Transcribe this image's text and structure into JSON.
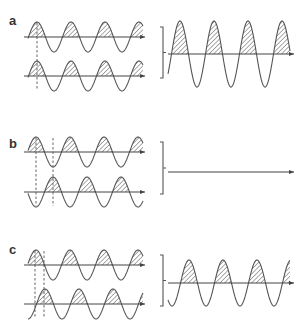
{
  "panels": [
    {
      "label": "a",
      "description": "Two in-phase waves sum to a wave of doubled amplitude (constructive interference)",
      "inputs": [
        {
          "axis_y": 37,
          "amp": 15,
          "phase_peak_x": 37,
          "period": 34
        },
        {
          "axis_y": 76,
          "amp": 15,
          "phase_peak_x": 37,
          "period": 34
        }
      ],
      "result": {
        "axis_y": 54,
        "amp": 33,
        "phase_peak_x": 180,
        "period": 34
      },
      "dashed_lines_x": [
        37
      ]
    },
    {
      "label": "b",
      "description": "Two waves half a period out of phase cancel (destructive interference)",
      "inputs": [
        {
          "axis_y": 152,
          "amp": 15,
          "phase_peak_x": 36,
          "period": 34
        },
        {
          "axis_y": 192,
          "amp": 15,
          "phase_peak_x": 53,
          "period": 34
        }
      ],
      "result": {
        "axis_y": 172,
        "amp": 0
      },
      "dashed_lines_x": [
        36,
        53
      ]
    },
    {
      "label": "c",
      "description": "Two waves partially out of phase sum to an intermediate amplitude",
      "inputs": [
        {
          "axis_y": 265,
          "amp": 15,
          "phase_peak_x": 36,
          "period": 34
        },
        {
          "axis_y": 304,
          "amp": 15,
          "phase_peak_x": 45,
          "period": 34
        }
      ],
      "result": {
        "axis_y": 283,
        "amp": 23,
        "phase_peak_x": 189,
        "period": 34
      },
      "dashed_lines_x": [
        35,
        44
      ]
    }
  ],
  "colors": {
    "line": "#555555",
    "hatch": "#555555",
    "background": "#ffffff"
  }
}
